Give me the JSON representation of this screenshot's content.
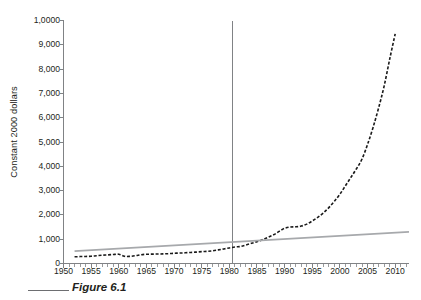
{
  "figure": {
    "caption_label": "Figure 6.1"
  },
  "chart_data": {
    "type": "line",
    "title": "",
    "xlabel": "",
    "ylabel": "Constant 2000 dollars",
    "xlim": [
      1950,
      2012.5
    ],
    "ylim": [
      0,
      10000
    ],
    "grid": false,
    "legend_position": "none",
    "y_ticks": [
      0,
      1000,
      2000,
      3000,
      4000,
      5000,
      6000,
      7000,
      8000,
      9000,
      10000
    ],
    "y_tick_labels": [
      "0",
      "1,000",
      "2,000",
      "3,000",
      "4,000",
      "5,000",
      "6,000",
      "7,000",
      "8,000",
      "9,000",
      "1,0000"
    ],
    "x_ticks": [
      1950,
      1955,
      1960,
      1965,
      1970,
      1975,
      1980,
      1985,
      1990,
      1995,
      2000,
      2005,
      2010
    ],
    "x_tick_labels": [
      "1950",
      "1955",
      "1960",
      "1965",
      "1970",
      "1975",
      "1980",
      "1985",
      "1990",
      "1995",
      "2000",
      "2005",
      "2010"
    ],
    "x_minor_tick_interval": 1,
    "annotations": [
      {
        "name": "reference-line-1980",
        "type": "vline",
        "x": 1980.5,
        "color": "#808285"
      }
    ],
    "series": [
      {
        "name": "Actual spending",
        "style": "dashed",
        "color": "#1a1a1a",
        "x": [
          1952,
          1953,
          1954,
          1955,
          1956,
          1957,
          1958,
          1959,
          1960,
          1961,
          1962,
          1963,
          1964,
          1965,
          1966,
          1967,
          1968,
          1969,
          1970,
          1971,
          1972,
          1973,
          1974,
          1975,
          1976,
          1977,
          1978,
          1979,
          1980,
          1981,
          1982,
          1983,
          1984,
          1985,
          1986,
          1987,
          1988,
          1989,
          1990,
          1991,
          1992,
          1993,
          1994,
          1995,
          1996,
          1997,
          1998,
          1999,
          2000,
          2001,
          2002,
          2003,
          2004,
          2005,
          2006,
          2007,
          2008,
          2009,
          2010
        ],
        "values": [
          275,
          285,
          290,
          300,
          320,
          340,
          355,
          370,
          380,
          300,
          295,
          320,
          360,
          380,
          385,
          390,
          395,
          405,
          420,
          430,
          440,
          455,
          470,
          490,
          500,
          520,
          560,
          600,
          640,
          680,
          700,
          760,
          830,
          900,
          980,
          1080,
          1180,
          1320,
          1450,
          1500,
          1510,
          1540,
          1620,
          1750,
          1900,
          2080,
          2300,
          2560,
          2850,
          3200,
          3550,
          3900,
          4300,
          4900,
          5600,
          6400,
          7300,
          8400,
          9450
        ]
      },
      {
        "name": "Trend line",
        "style": "solid",
        "color": "#a7a9ac",
        "x": [
          1952,
          2012.5
        ],
        "values": [
          510,
          1300
        ]
      }
    ]
  }
}
